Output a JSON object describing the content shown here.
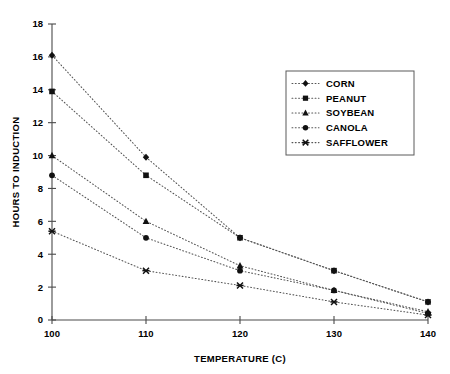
{
  "chart_data": {
    "type": "line",
    "title": "",
    "xlabel": "TEMPERATURE (C)",
    "ylabel": "HOURS TO INDUCTION",
    "x": [
      100,
      110,
      120,
      130,
      140
    ],
    "xlim": [
      100,
      140
    ],
    "ylim": [
      0,
      18
    ],
    "xticks": [
      "100",
      "110",
      "120",
      "130",
      "140"
    ],
    "yticks": [
      "0",
      "2",
      "4",
      "6",
      "8",
      "10",
      "12",
      "14",
      "16",
      "18"
    ],
    "grid": false,
    "legend_position": "upper right",
    "line_style": "dotted",
    "series": [
      {
        "name": "CORN",
        "marker": "diamond",
        "values": [
          16.1,
          9.9,
          5.0,
          3.0,
          1.1
        ]
      },
      {
        "name": "PEANUT",
        "marker": "square",
        "values": [
          13.9,
          8.8,
          5.0,
          3.0,
          1.1
        ]
      },
      {
        "name": "SOYBEAN",
        "marker": "triangle",
        "values": [
          10.0,
          6.0,
          3.3,
          1.8,
          0.5
        ]
      },
      {
        "name": "CANOLA",
        "marker": "circle",
        "values": [
          8.8,
          5.0,
          3.0,
          1.8,
          0.4
        ]
      },
      {
        "name": "SAFFLOWER",
        "marker": "x",
        "values": [
          5.4,
          3.0,
          2.1,
          1.1,
          0.3
        ]
      }
    ]
  },
  "legend": {
    "items": [
      {
        "label": "CORN"
      },
      {
        "label": "PEANUT"
      },
      {
        "label": "SOYBEAN"
      },
      {
        "label": "CANOLA"
      },
      {
        "label": "SAFFLOWER"
      }
    ]
  },
  "colors": {
    "ink": "#111111",
    "axis": "#4a4a4a",
    "line": "#555555",
    "background": "#ffffff"
  }
}
